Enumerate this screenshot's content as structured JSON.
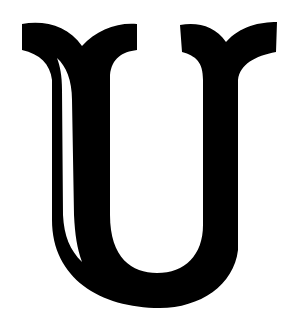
{
  "image": {
    "subject": "Decorative serif capital letter",
    "letter": "U",
    "colors": {
      "background": "#ffffff",
      "glyph": "#000000"
    }
  }
}
